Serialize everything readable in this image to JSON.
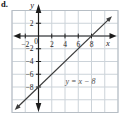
{
  "page": {
    "item_label": "d."
  },
  "chart_data": {
    "type": "line",
    "title": "",
    "equation_label": "y = x − 8",
    "xlabel": "x",
    "ylabel": "y",
    "origin_label": "0",
    "xlim": [
      -4,
      12
    ],
    "ylim": [
      -12,
      4
    ],
    "grid": true,
    "grid_step": 2,
    "x_ticks": [
      -2,
      2,
      4,
      6,
      8
    ],
    "x_tick_labels": [
      "−2",
      "2",
      "4",
      "6",
      "8"
    ],
    "y_ticks": [
      2,
      -2,
      -4,
      -6,
      -8
    ],
    "y_tick_labels": [
      "2",
      "−2",
      "−4",
      "−6",
      "−8"
    ],
    "series": [
      {
        "name": "y = x − 8",
        "slope": 1,
        "y_intercept": -8,
        "x_intercept": 8,
        "points": [
          [
            -2,
            -10
          ],
          [
            0,
            -8
          ],
          [
            2,
            -6
          ],
          [
            4,
            -4
          ],
          [
            6,
            -2
          ],
          [
            8,
            0
          ],
          [
            10,
            2
          ]
        ]
      }
    ],
    "colors": {
      "axis": "#1c1c1c",
      "line": "#3c3c3c",
      "grid": "#ccd3d9",
      "grid_border": "#b7bec5",
      "tick_text": "#1e1e1e",
      "equation_text": "#4d4d4d",
      "background": "#ffffff"
    }
  }
}
